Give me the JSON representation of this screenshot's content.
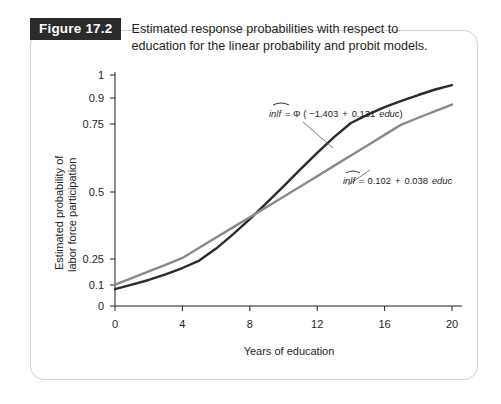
{
  "figure": {
    "tag": "Figure 17.2",
    "caption_line1": "Estimated response probabilities with respect to",
    "caption_line2": "education for the linear probability and probit models."
  },
  "chart_data": {
    "type": "line",
    "title": "Estimated response probabilities with respect to education for the linear probability and probit models.",
    "xlabel": "Years of education",
    "ylabel_line1": "Estimated probability of",
    "ylabel_line2": "labor force participation",
    "xlim": [
      0,
      20
    ],
    "ylim": [
      0,
      1
    ],
    "grid": false,
    "legend_position": "inline-annotations",
    "xticks": [
      0,
      4,
      8,
      12,
      16,
      20
    ],
    "xtick_labels": [
      "0",
      "4",
      "8",
      "12",
      "16",
      "20"
    ],
    "yticks": [
      0,
      0.1,
      0.25,
      0.5,
      0.75,
      0.9,
      1
    ],
    "ytick_labels": [
      "0",
      "0.1",
      "0.25",
      "0.5",
      "0.75",
      "0.9",
      "1"
    ],
    "x": [
      0,
      1,
      2,
      3,
      4,
      5,
      6,
      7,
      8,
      9,
      10,
      11,
      12,
      13,
      14,
      15,
      16,
      17,
      18,
      19,
      20
    ],
    "series": [
      {
        "name": "probit",
        "color": "#2b2b2b",
        "equation_plain": "inlf = Φ (−1.403 + 0.131 educ)",
        "equation_parts": {
          "lhs": "inlf",
          "eq": "= Φ (",
          "intercept": "−1.403",
          "plus": "+",
          "slope": "0.131",
          "var": "educ",
          "close": ")"
        },
        "intercept": -1.403,
        "slope": 0.131,
        "values": [
          0.08,
          0.102,
          0.129,
          0.161,
          0.198,
          0.241,
          0.289,
          0.342,
          0.399,
          0.459,
          0.521,
          0.583,
          0.644,
          0.702,
          0.756,
          0.804,
          0.847,
          0.883,
          0.913,
          0.937,
          0.956
        ]
      },
      {
        "name": "linear-probability",
        "color": "#8a8a8a",
        "equation_plain": "inlf = 0.102 + 0.038 educ",
        "equation_parts": {
          "lhs": "inlf",
          "eq": "=",
          "intercept": "0.102",
          "plus": "+",
          "slope": "0.038",
          "var": "educ",
          "close": ""
        },
        "intercept": 0.102,
        "slope": 0.038,
        "values": [
          0.102,
          0.14,
          0.178,
          0.216,
          0.254,
          0.292,
          0.33,
          0.368,
          0.406,
          0.444,
          0.482,
          0.52,
          0.558,
          0.596,
          0.634,
          0.672,
          0.71,
          0.748,
          0.786,
          0.824,
          0.862
        ]
      }
    ]
  }
}
